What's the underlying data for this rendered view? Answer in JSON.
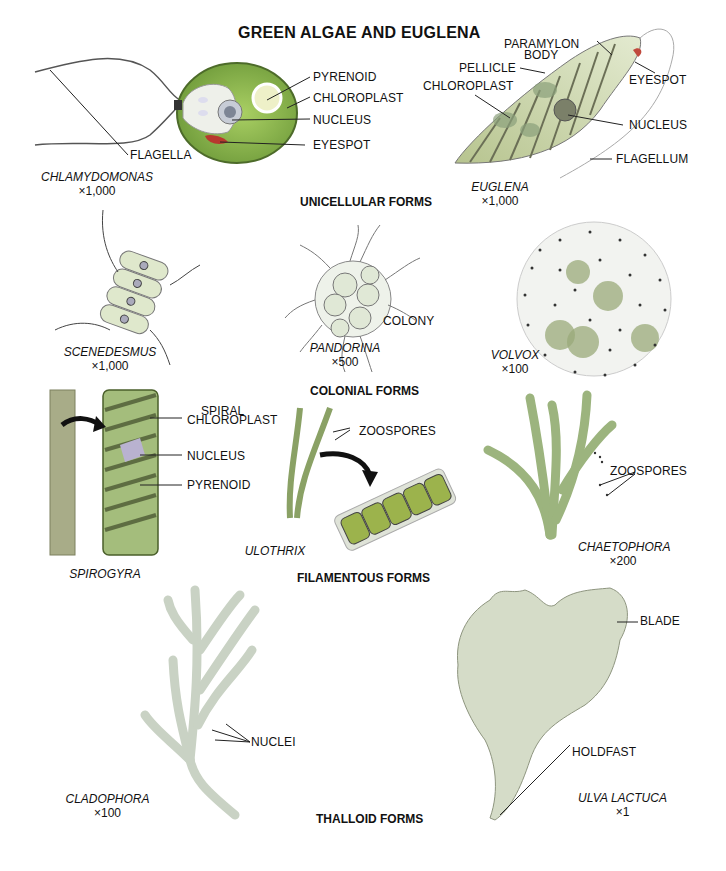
{
  "title": "GREEN ALGAE AND EUGLENA",
  "sections": {
    "unicellular": "UNICELLULAR FORMS",
    "colonial": "COLONIAL FORMS",
    "filamentous": "FILAMENTOUS FORMS",
    "thalloid": "THALLOID FORMS"
  },
  "organisms": {
    "chlamydomonas": {
      "name": "CHLAMYDOMONAS",
      "magnification": "×1,000",
      "labels": [
        "PYRENOID",
        "CHLOROPLAST",
        "NUCLEUS",
        "EYESPOT",
        "FLAGELLA"
      ]
    },
    "euglena": {
      "name": "EUGLENA",
      "magnification": "×1,000",
      "labels": [
        "PARAMYLON",
        "BODY",
        "PELLICLE",
        "CHLOROPLAST",
        "EYESPOT",
        "NUCLEUS",
        "FLAGELLUM"
      ]
    },
    "scenedesmus": {
      "name": "SCENEDESMUS",
      "magnification": "×1,000"
    },
    "pandorina": {
      "name": "PANDORINA",
      "magnification": "×500",
      "labels": [
        "COLONY"
      ]
    },
    "volvox": {
      "name": "VOLVOX",
      "magnification": "×100"
    },
    "spirogyra": {
      "name": "SPIROGYRA",
      "labels": [
        "SPIRAL",
        "CHLOROPLAST",
        "NUCLEUS",
        "PYRENOID"
      ]
    },
    "ulothrix": {
      "name": "ULOTHRIX",
      "labels": [
        "ZOOSPORES"
      ]
    },
    "chaetophora": {
      "name": "CHAETOPHORA",
      "magnification": "×200",
      "labels": [
        "ZOOSPORES"
      ]
    },
    "cladophora": {
      "name": "CLADOPHORA",
      "magnification": "×100",
      "labels": [
        "NUCLEI"
      ]
    },
    "ulva": {
      "name": "ULVA LACTUCA",
      "magnification": "×1",
      "labels": [
        "BLADE",
        "HOLDFAST"
      ]
    }
  },
  "colors": {
    "chloroplast_green": "#8cc04a",
    "cell_wall": "#6b7d3a",
    "eyespot_red": "#b8392e",
    "pale_green": "#c9d9b2",
    "ulva_green": "#d3dcc6"
  }
}
